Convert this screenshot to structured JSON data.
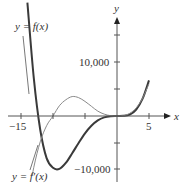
{
  "chart_data": {
    "type": "line",
    "title": "",
    "xlabel": "x",
    "ylabel": "y",
    "x_ticks": [
      -15,
      -10,
      -5,
      0,
      5
    ],
    "x_tick_labels": [
      "−15",
      "5"
    ],
    "y_ticks": [
      -10000,
      -5000,
      0,
      5000,
      10000,
      15000
    ],
    "y_tick_labels": [
      "10,000",
      "−10,000"
    ],
    "xlim": [
      -16.5,
      8
    ],
    "ylim": [
      -12500,
      18000
    ],
    "grid": false,
    "series": [
      {
        "name": "y = f(x)",
        "style": "thick dark",
        "x": [
          -14,
          -13,
          -12,
          -11,
          -10,
          -9,
          -8,
          -7,
          -6,
          -5,
          -4,
          -3,
          -2,
          -1,
          0,
          1,
          2,
          3,
          4,
          5
        ],
        "y": [
          21000,
          7000,
          -2500,
          -7800,
          -9600,
          -9800,
          -8700,
          -6900,
          -5000,
          -3200,
          -1800,
          -800,
          -250,
          -40,
          0,
          30,
          280,
          1200,
          3200,
          6600
        ]
      },
      {
        "name": "y = f′(x)",
        "style": "thin gray",
        "x": [
          -14,
          -13,
          -12,
          -11,
          -10,
          -9,
          -8,
          -7,
          -6,
          -5,
          -4,
          -3,
          -2,
          -1,
          0,
          1,
          2,
          3,
          4,
          5
        ],
        "y": [
          -16000,
          -9500,
          -4800,
          -1800,
          0,
          1900,
          3000,
          3600,
          3400,
          2700,
          1800,
          900,
          350,
          60,
          0,
          80,
          500,
          1500,
          3300,
          6000
        ]
      }
    ],
    "annotations": [
      "y = f(x)",
      "y = f′(x)"
    ]
  },
  "labels": {
    "y_axis": "y",
    "x_axis": "x",
    "x_neg15": "−15",
    "x_5": "5",
    "y_10000": "10,000",
    "y_neg10000": "−10,000",
    "f_label": "y = f(x)",
    "fprime_label": "y = f′(x)"
  },
  "colors": {
    "f_curve": "#3a3a3a",
    "fprime_curve": "#8a8a8a",
    "axes": "#555555",
    "text": "#333333"
  }
}
